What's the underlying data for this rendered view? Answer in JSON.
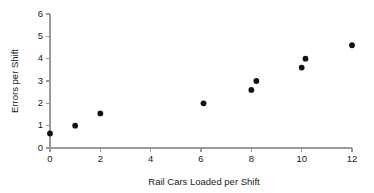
{
  "chart_data": {
    "type": "scatter",
    "title": "",
    "xlabel": "Rail Cars Loaded per Shift",
    "ylabel": "Errors per Shift",
    "xlim": [
      0,
      12
    ],
    "ylim": [
      0,
      6
    ],
    "xticks": [
      "0",
      "2",
      "4",
      "6",
      "8",
      "10",
      "12"
    ],
    "xtick_values": [
      0,
      2,
      4,
      6,
      8,
      10,
      12
    ],
    "yticks": [
      "0",
      "1",
      "2",
      "3",
      "4",
      "5",
      "6"
    ],
    "ytick_values": [
      0,
      1,
      2,
      3,
      4,
      5,
      6
    ],
    "grid": false,
    "legend": null,
    "marker": "filled-circle",
    "marker_color": "#121212",
    "axis_color": "#9a9a9a",
    "background_color": "#ffffff",
    "points": [
      {
        "x": 0,
        "y": 0.65
      },
      {
        "x": 1,
        "y": 1.0
      },
      {
        "x": 2,
        "y": 1.55
      },
      {
        "x": 6.1,
        "y": 2.0
      },
      {
        "x": 8.0,
        "y": 2.6
      },
      {
        "x": 8.2,
        "y": 3.0
      },
      {
        "x": 10.0,
        "y": 3.6
      },
      {
        "x": 10.15,
        "y": 4.0
      },
      {
        "x": 12,
        "y": 4.6
      }
    ]
  }
}
